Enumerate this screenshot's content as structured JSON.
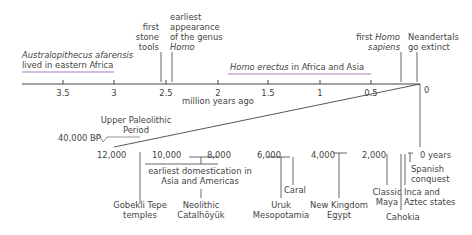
{
  "top_timeline": {
    "unit_label": "million years ago",
    "ticks": [
      "3.5",
      "3",
      "2.5",
      "2",
      "1.5",
      "1",
      "0.5",
      "0"
    ],
    "ranges": [
      {
        "label_italic": "Australopithecus afarensis",
        "label_rest": "lived in eastern Africa",
        "from": 3.9,
        "to": 3.0,
        "color": "#c9a6d6"
      },
      {
        "label_italic": "Homo erectus",
        "label_rest": " in Africa and Asia",
        "from": 1.9,
        "to": 0.5,
        "color": "#c9a6d6"
      }
    ],
    "events": [
      {
        "lines": [
          "first",
          "stone",
          "tools"
        ],
        "at": 2.6
      },
      {
        "lines": [
          "earliest",
          "appearance",
          "of the genus"
        ],
        "italic_line": "Homo",
        "at": 2.5
      },
      {
        "line1_pre": "first ",
        "line1_italic": "Homo",
        "line2_italic": "sapiens",
        "at": 0.2
      },
      {
        "lines": [
          "Neandertals",
          "go extinct"
        ],
        "at": 0.03
      }
    ]
  },
  "zoom_connector": {
    "period_label": [
      "Upper Paleolithic",
      "Period"
    ],
    "break_label": "40,000 BP"
  },
  "bottom_timeline": {
    "ticks": [
      "12,000",
      "10,000",
      "8,000",
      "6,000",
      "4,000",
      "2,000",
      "0 years"
    ],
    "axis_colors": {
      "start": "#e8707a",
      "end": "#a8d8b0"
    },
    "events": [
      {
        "lines": [
          "Gobekli Tepe",
          "temples"
        ]
      },
      {
        "lines": [
          "earliest domestication in",
          "Asia and Americas"
        ]
      },
      {
        "lines": [
          "Neolithic",
          "Catalhöyük"
        ]
      },
      {
        "lines": [
          "Uruk",
          "Mesopotamia"
        ]
      },
      {
        "lines": [
          "Caral"
        ]
      },
      {
        "lines": [
          "New Kingdom",
          "Egypt"
        ]
      },
      {
        "lines": [
          "Classic",
          "Maya"
        ]
      },
      {
        "lines": [
          "Cahokia"
        ]
      },
      {
        "lines": [
          "Inca and",
          "Aztec states"
        ]
      },
      {
        "lines": [
          "Spanish",
          "conquest"
        ]
      }
    ]
  }
}
